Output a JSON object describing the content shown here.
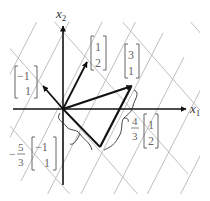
{
  "diagram": {
    "axes": {
      "x_label": "x",
      "x_sub": "1",
      "y_label": "x",
      "y_sub": "2"
    },
    "vectors": [
      {
        "name": "v-neg1-1",
        "components": [
          "−1",
          "1"
        ]
      },
      {
        "name": "v-1-2",
        "components": [
          "1",
          "2"
        ]
      },
      {
        "name": "v-3-1",
        "components": [
          "3",
          "1"
        ]
      }
    ],
    "annotations": {
      "coef_a": {
        "sign": "−",
        "num": "5",
        "den": "3",
        "vector": [
          "−1",
          "1"
        ]
      },
      "coef_b": {
        "num": "4",
        "den": "3",
        "vector": [
          "1",
          "2"
        ]
      }
    },
    "colors": {
      "grid": "#b8b8b8",
      "axis": "#111111",
      "text": "#333333"
    }
  }
}
